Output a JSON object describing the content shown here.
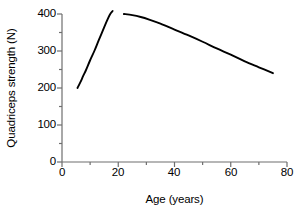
{
  "chart_data": {
    "type": "line",
    "title": "",
    "xlabel": "Age (years)",
    "ylabel": "Quadriceps strength (N)",
    "xlim": [
      0,
      80
    ],
    "ylim": [
      0,
      400
    ],
    "xticks": [
      0,
      20,
      40,
      60,
      80
    ],
    "yticks": [
      0,
      100,
      200,
      300,
      400
    ],
    "xtick_labels": [
      "0",
      "20",
      "40",
      "60",
      "80"
    ],
    "ytick_labels": [
      "0",
      "100",
      "200",
      "300",
      "400"
    ],
    "x_minor_tick_interval": 10,
    "y_minor_tick_interval": 50,
    "grid": false,
    "legend": null,
    "line_color": "#000000",
    "axis_color": "#6e6e6e",
    "background": "#ffffff",
    "series": [
      {
        "name": "Growth phase",
        "comment": "rising limb, childhood through late adolescence",
        "x": [
          5.5,
          6.5,
          7.5,
          8.5,
          10.0,
          11.5,
          13.0,
          14.5,
          16.0,
          17.0,
          18.0
        ],
        "y": [
          200,
          215,
          232,
          248,
          275,
          300,
          328,
          355,
          382,
          398,
          408
        ]
      },
      {
        "name": "Decline phase",
        "comment": "adult plateau then progressive decline with age",
        "x": [
          22.0,
          25.0,
          28.0,
          31.0,
          35.0,
          40.0,
          45.0,
          50.0,
          55.0,
          60.0,
          65.0,
          70.0,
          75.0
        ],
        "y": [
          400,
          397,
          392,
          385,
          374,
          358,
          342,
          325,
          307,
          290,
          272,
          256,
          240
        ]
      }
    ]
  }
}
